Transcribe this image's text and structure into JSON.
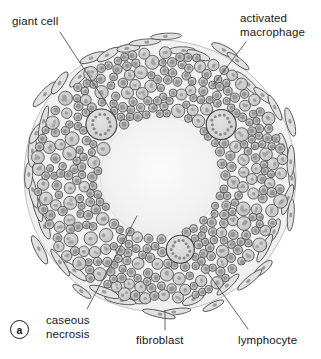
{
  "figure": {
    "panel_letter": "a",
    "background_color": "#ffffff"
  },
  "labels": [
    {
      "id": "giant-cell",
      "text": "giant cell",
      "x": 12,
      "y": 15,
      "leader": {
        "x1": 60,
        "y1": 32,
        "x2": 116,
        "y2": 118
      }
    },
    {
      "id": "activated-macrophage",
      "text": "activated\nmacrophage",
      "x": 240,
      "y": 12,
      "leader": {
        "x1": 246,
        "y1": 42,
        "x2": 214,
        "y2": 84
      }
    },
    {
      "id": "caseous-necrosis",
      "text": "caseous\nnecrosis",
      "x": 46,
      "y": 314,
      "leader": {
        "x1": 87,
        "y1": 309,
        "x2": 137,
        "y2": 216
      }
    },
    {
      "id": "fibroblast",
      "text": "fibroblast",
      "x": 136,
      "y": 334,
      "leader": {
        "x1": 165,
        "y1": 330,
        "x2": 165,
        "y2": 311
      }
    },
    {
      "id": "lymphocyte",
      "text": "lymphocyte",
      "x": 238,
      "y": 334,
      "leader": {
        "x1": 248,
        "y1": 329,
        "x2": 208,
        "y2": 273
      }
    }
  ],
  "colors": {
    "ink": "#2b2b2e",
    "outline": "#3a3a3e",
    "necrosis_fill": "#f0f0f0",
    "granuloma_fill": "#f3f3f3",
    "macrophage_fill": "#c9c9c9",
    "macrophage_nucleus": "#9d9d9d",
    "lymphocyte_fill": "#bcbcbc",
    "lymphocyte_nucleus": "#8d8d8d",
    "fibroblast_fill": "#e0e0e0",
    "giant_cell_fill": "#d8d8d8",
    "leader_line": "#4a4a4e",
    "label_text": "#17171a"
  },
  "geometry": {
    "center_x": 160,
    "center_y": 176,
    "outer_radius": 136,
    "fibroblast_ring_radius": 131,
    "macrophage_band_outer": 124,
    "macrophage_band_inner": 62,
    "necrosis_radius": 60
  },
  "cell_types": [
    {
      "name": "lymphocyte",
      "shape": "small-circle",
      "description": "small dark-rimmed circle with nucleus"
    },
    {
      "name": "activated macrophage",
      "shape": "large-circle",
      "description": "larger pale circle with granular nucleus"
    },
    {
      "name": "giant cell",
      "shape": "large-multinucleate-circle",
      "count": 3,
      "description": "large cell with ring of many small nuclei"
    },
    {
      "name": "fibroblast",
      "shape": "spindle-ellipse",
      "description": "elongated tangential spindle cell at periphery"
    },
    {
      "name": "caseous necrosis",
      "shape": "central-zone",
      "description": "pale amorphous central core"
    }
  ]
}
